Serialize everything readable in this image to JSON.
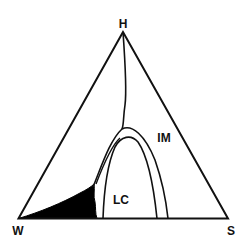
{
  "diagram": {
    "type": "ternary-phase-diagram",
    "vertices": {
      "top": "H",
      "left": "W",
      "right": "S"
    },
    "regions": {
      "im": "IM",
      "lc": "LC"
    },
    "colors": {
      "line": "#111111",
      "fill": "#000000",
      "background": "#ffffff"
    }
  }
}
